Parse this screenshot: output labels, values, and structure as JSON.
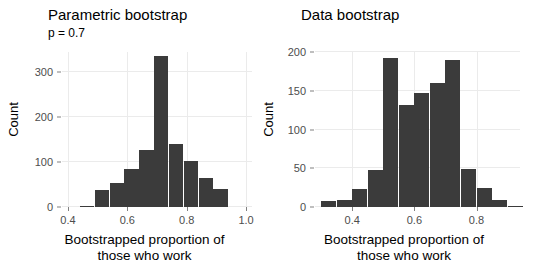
{
  "figure": {
    "bar_color": "#3b3b3b",
    "grid_color": "#ebebeb",
    "background": "#ffffff"
  },
  "chart_data": [
    {
      "type": "bar",
      "panel": "left",
      "title": "Parametric bootstrap",
      "subtitle": "p = 0.7",
      "xlabel_line1": "Bootstrapped proportion of",
      "xlabel_line2": "those who work",
      "ylabel": "Count",
      "xlim": [
        0.38,
        1.02
      ],
      "ylim": [
        0,
        345
      ],
      "xticks": [
        0.4,
        0.6,
        0.8,
        1.0
      ],
      "xtick_labels": [
        "0.4",
        "0.6",
        "0.8",
        "1.0"
      ],
      "yticks": [
        0,
        100,
        200,
        300
      ],
      "ytick_labels": [
        "0",
        "100",
        "200",
        "300"
      ],
      "grid": true,
      "bin_width": 0.05,
      "bin_starts": [
        0.44,
        0.49,
        0.54,
        0.59,
        0.64,
        0.69,
        0.74,
        0.79,
        0.84,
        0.89
      ],
      "values": [
        2,
        37,
        54,
        85,
        126,
        337,
        141,
        102,
        64,
        39
      ]
    },
    {
      "type": "bar",
      "panel": "right",
      "title": "Data bootstrap",
      "subtitle": "",
      "xlabel_line1": "Bootstrapped proportion of",
      "xlabel_line2": "those who work",
      "ylabel": "Count",
      "xlim": [
        0.28,
        0.94
      ],
      "ylim": [
        0,
        200
      ],
      "xticks": [
        0.4,
        0.6,
        0.8
      ],
      "xtick_labels": [
        "0.4",
        "0.6",
        "0.8"
      ],
      "yticks": [
        0,
        50,
        100,
        150,
        200
      ],
      "ytick_labels": [
        "0",
        "50",
        "100",
        "150",
        "200"
      ],
      "grid": true,
      "bin_width": 0.05,
      "bin_starts": [
        0.3,
        0.35,
        0.4,
        0.45,
        0.5,
        0.55,
        0.6,
        0.65,
        0.7,
        0.75,
        0.8,
        0.85,
        0.9
      ],
      "values": [
        8,
        9,
        23,
        48,
        192,
        131,
        147,
        160,
        190,
        49,
        24,
        9,
        1
      ]
    }
  ]
}
